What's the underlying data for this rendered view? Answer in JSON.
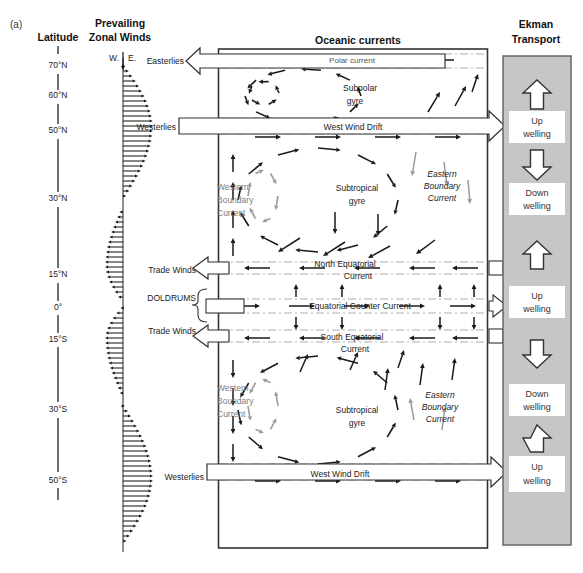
{
  "figure_label": "(a)",
  "latitude": {
    "title": "Latitude",
    "ticks": [
      "70°N",
      "60°N",
      "50°N",
      "30°N",
      "15°N",
      "0°",
      "15°S",
      "30°S",
      "50°S"
    ]
  },
  "wind": {
    "title": [
      "Prevailing",
      "Zonal Winds"
    ],
    "axis_west": "W.",
    "axis_east": "E.",
    "zones": {
      "easterlies": "Easterlies",
      "westerlies_north": "Westerlies",
      "trade_winds_north": "Trade Winds",
      "doldrums": "DOLDRUMS",
      "trade_winds_south": "Trade Winds",
      "westerlies_south": "Westerlies"
    }
  },
  "ocean": {
    "title": "Oceanic currents",
    "labels": {
      "polar_current": "Polar current",
      "subpolar_gyre": [
        "Subpolar",
        "gyre"
      ],
      "west_wind_drift_north": "West Wind Drift",
      "western_boundary_north": [
        "Western",
        "Boundary",
        "Current"
      ],
      "subtropical_gyre_north": [
        "Subtropical",
        "gyre"
      ],
      "eastern_boundary_north": [
        "Eastern",
        "Boundary",
        "Current"
      ],
      "north_equatorial_current": [
        "North Equatorial",
        "Current"
      ],
      "equatorial_counter_current": "Equatorial Counter Current",
      "south_equatorial_current": [
        "South Equatorial",
        "Current"
      ],
      "western_boundary_south": [
        "Western",
        "Boundary",
        "Current"
      ],
      "subtropical_gyre_south": [
        "Subtropical",
        "gyre"
      ],
      "eastern_boundary_south": [
        "Eastern",
        "Boundary",
        "Current"
      ],
      "west_wind_drift_south": "West Wind Drift"
    }
  },
  "ekman": {
    "title": [
      "Ekman",
      "Transport"
    ],
    "arrows": [
      "up",
      "down",
      "up",
      "down",
      "up"
    ],
    "boxes": [
      [
        "Up",
        "welling"
      ],
      [
        "Down",
        "welling"
      ],
      [
        "Up",
        "welling"
      ],
      [
        "Down",
        "welling"
      ],
      [
        "Up",
        "welling"
      ]
    ]
  },
  "colors": {
    "ekman_gray": "#c6c6c6",
    "arrow_black": "#1a1a1a",
    "arrow_gray": "#9a9a9a",
    "text_gray": "#7d7d7d"
  }
}
